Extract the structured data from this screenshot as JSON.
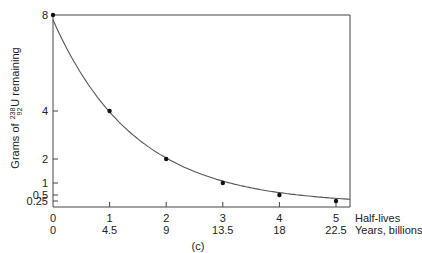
{
  "chart_data": {
    "type": "scatter",
    "title": "",
    "caption": "(c)",
    "xlabel": "Half-lives",
    "xlabel_secondary": "Years, billions",
    "ylabel": "Grams of 238/92 U remaining",
    "ylabel_parts": {
      "prefix": "Grams of",
      "mass_number": "238",
      "atomic_number": "92",
      "element": "U",
      "suffix": "remaining"
    },
    "x_ticks": [
      "0",
      "1",
      "2",
      "3",
      "4",
      "5"
    ],
    "x_ticks_secondary": [
      "0",
      "4.5",
      "9",
      "13.5",
      "18",
      "22.5"
    ],
    "y_ticks": [
      "8",
      "4",
      "2",
      "1",
      "0.5",
      "0.25"
    ],
    "xlim": [
      0,
      5
    ],
    "ylim": [
      0,
      8
    ],
    "grid": false,
    "fit_curve": "exponential decay y = 8 * 0.5^x",
    "series": [
      {
        "name": "U-238 remaining",
        "x": [
          0,
          1,
          2,
          3,
          4,
          5
        ],
        "values": [
          8,
          4,
          2,
          1,
          0.5,
          0.25
        ]
      }
    ]
  },
  "labels": {
    "caption": "(c)",
    "half_lives": "Half-lives",
    "years": "Years, billions",
    "ylabel_prefix": "Grams of",
    "ylabel_mass": "238",
    "ylabel_atomic": "92",
    "ylabel_element": "U",
    "ylabel_suffix": "remaining"
  }
}
